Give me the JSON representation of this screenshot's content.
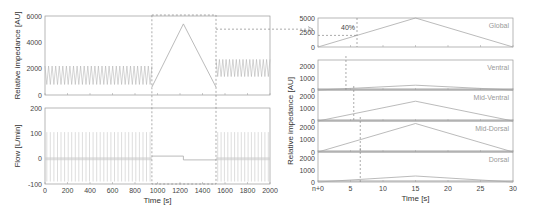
{
  "chart_data": [
    {
      "type": "line",
      "title": "",
      "xlabel": "",
      "ylabel": "Relative impedance [AU]",
      "xlim": [
        0,
        2000
      ],
      "ylim": [
        0,
        6000
      ],
      "yticks": [
        "0",
        "2000",
        "4000",
        "6000"
      ],
      "description": "Oscillating impedance ~800-2200 AU until ~950 s, then linear rise to peak ~5400 at ~1230 s and fall to ~600 at ~1520 s, then oscillation ~1400-2700 AU",
      "series": [
        {
          "name": "Impedance (breathing phase 1)",
          "x_range": [
            0,
            950
          ],
          "min": 800,
          "max": 2200
        },
        {
          "name": "Impedance (slow inflation)",
          "x": [
            950,
            1230,
            1520
          ],
          "values": [
            600,
            5400,
            600
          ]
        },
        {
          "name": "Impedance (breathing phase 2)",
          "x_range": [
            1520,
            2000
          ],
          "min": 1400,
          "max": 2700
        }
      ]
    },
    {
      "type": "line",
      "title": "",
      "xlabel": "Time [s]",
      "ylabel": "Flow [L/min]",
      "xlim": [
        0,
        2000
      ],
      "ylim": [
        -100,
        200
      ],
      "xticks": [
        "0",
        "200",
        "400",
        "600",
        "800",
        "1000",
        "1200",
        "1400",
        "1600",
        "1800",
        "2000"
      ],
      "yticks": [
        "-100",
        "0",
        "100",
        "200"
      ],
      "series": [
        {
          "name": "Flow (breathing phase 1)",
          "x_range": [
            0,
            950
          ],
          "min": -90,
          "max": 105
        },
        {
          "name": "Flow (slow inflation)",
          "x": [
            950,
            1230,
            1230,
            1520
          ],
          "values": [
            10,
            10,
            -5,
            -5
          ]
        },
        {
          "name": "Flow (breathing phase 2)",
          "x_range": [
            1520,
            2000
          ],
          "min": -90,
          "max": 105
        }
      ]
    },
    {
      "type": "line",
      "title": "",
      "xlabel": "Time [s]",
      "ylabel": "Relative impedance [AU]",
      "xlim": [
        0,
        30
      ],
      "xticks": [
        "n+0",
        "5",
        "10",
        "15",
        "20",
        "25",
        "30"
      ],
      "annotation": "40%",
      "panels": [
        {
          "name": "Global",
          "ylim": [
            0,
            5000
          ],
          "yticks": [
            "0",
            "2500",
            "5000"
          ],
          "x": [
            0,
            15,
            30
          ],
          "values": [
            0,
            5000,
            0
          ],
          "marker_x": 6,
          "marker_y": 2000
        },
        {
          "name": "Ventral",
          "ylim": [
            0,
            2500
          ],
          "yticks": [
            "0",
            "1000",
            "2000"
          ],
          "x": [
            0,
            15,
            30
          ],
          "values": [
            0,
            400,
            0
          ],
          "marker_x": 4.3
        },
        {
          "name": "Mid-Ventral",
          "ylim": [
            0,
            2500
          ],
          "yticks": [
            "0",
            "1000",
            "2000"
          ],
          "x": [
            0,
            15,
            30
          ],
          "values": [
            0,
            1600,
            0
          ],
          "marker_x": 5.5
        },
        {
          "name": "Mid-Dorsal",
          "ylim": [
            0,
            2500
          ],
          "yticks": [
            "0",
            "1000",
            "2000"
          ],
          "x": [
            0,
            15,
            30
          ],
          "values": [
            0,
            2300,
            0
          ],
          "marker_x": 6.5
        },
        {
          "name": "Dorsal",
          "ylim": [
            0,
            2500
          ],
          "yticks": [
            "0",
            "1000",
            "2000"
          ],
          "x": [
            0,
            15,
            30
          ],
          "values": [
            0,
            500,
            0
          ],
          "marker_x": 6.5
        }
      ]
    }
  ],
  "labels": {
    "left_top_ylabel": "Relative impedance [AU]",
    "left_bottom_ylabel": "Flow [L/min]",
    "left_xlabel": "Time [s]",
    "right_ylabel": "Relative impedance [AU]",
    "right_xlabel": "Time [s]",
    "annotation_40": "40%",
    "regions": [
      "Global",
      "Ventral",
      "Mid-Ventral",
      "Mid-Dorsal",
      "Dorsal"
    ],
    "left_top_yticks": [
      "6000",
      "4000",
      "2000",
      "0"
    ],
    "left_bottom_yticks": [
      "200",
      "100",
      "0",
      "-100"
    ],
    "left_xticks": [
      "0",
      "200",
      "400",
      "600",
      "800",
      "1000",
      "1200",
      "1400",
      "1600",
      "1800",
      "2000"
    ],
    "right_xticks": [
      "n+0",
      "5",
      "10",
      "15",
      "20",
      "25",
      "30"
    ],
    "global_yticks": [
      "5000",
      "2500",
      "0"
    ],
    "region_yticks": [
      "2000",
      "1000",
      "0"
    ]
  }
}
